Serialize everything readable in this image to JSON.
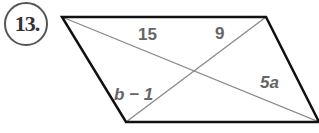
{
  "problem": {
    "number": "13."
  },
  "figure": {
    "shape": "parallelogram",
    "vertices": [
      [
        62,
        17
      ],
      [
        266,
        17
      ],
      [
        319,
        122
      ],
      [
        126,
        122
      ]
    ],
    "labels": {
      "top_left_segment": "15",
      "top_right_segment": "9",
      "bottom_left_segment": "b − 1",
      "bottom_right_segment": "5a"
    },
    "colors": {
      "outline": "#111111",
      "diagonal": "#888888",
      "label": "#666666"
    }
  }
}
